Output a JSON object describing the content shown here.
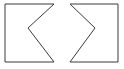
{
  "figure": {
    "background_color": "#ffffff",
    "stroke_color": "#3a3a3a",
    "fill_color": "#ffffff",
    "stroke_width": 1,
    "canvas": {
      "width": 124,
      "height": 69
    },
    "shapes": [
      {
        "id": "left-shape",
        "name": "left-chevron-notch-polygon",
        "description": "Rectangle with a V-shaped notch cut into its right edge, pointing left",
        "notch_side": "right",
        "notch_direction": "left",
        "points": "5,4 54,4 28,28 54,62 5,62",
        "vertices": [
          {
            "x": 5,
            "y": 4,
            "role": "top-left-corner"
          },
          {
            "x": 54,
            "y": 4,
            "role": "top-right-corner"
          },
          {
            "x": 28,
            "y": 28,
            "role": "notch-apex"
          },
          {
            "x": 54,
            "y": 62,
            "role": "bottom-right-corner"
          },
          {
            "x": 5,
            "y": 62,
            "role": "bottom-left-corner"
          }
        ]
      },
      {
        "id": "right-shape",
        "name": "right-chevron-notch-polygon",
        "description": "Rectangle with a V-shaped notch cut into its left edge, pointing right",
        "notch_side": "left",
        "notch_direction": "right",
        "points": "70,4 118,4 118,62 70,62 95,28",
        "vertices": [
          {
            "x": 70,
            "y": 4,
            "role": "top-left-corner"
          },
          {
            "x": 118,
            "y": 4,
            "role": "top-right-corner"
          },
          {
            "x": 118,
            "y": 62,
            "role": "bottom-right-corner"
          },
          {
            "x": 70,
            "y": 62,
            "role": "bottom-left-corner"
          },
          {
            "x": 95,
            "y": 28,
            "role": "notch-apex"
          }
        ]
      }
    ]
  }
}
